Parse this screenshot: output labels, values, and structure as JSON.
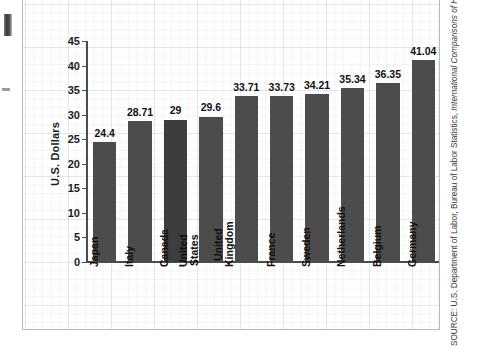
{
  "chart_data": {
    "type": "bar",
    "title": "",
    "subtitle": "",
    "xlabel": "",
    "ylabel": "U.S. Dollars",
    "ylim": [
      0,
      45
    ],
    "ytick_step": 5,
    "yticks": [
      "0",
      "5",
      "10",
      "15",
      "20",
      "25",
      "30",
      "35",
      "40",
      "45"
    ],
    "grid": true,
    "legend": false,
    "legend_position": "none",
    "categories": [
      "Japan",
      "Italy",
      "Canada",
      "United\nStates",
      "United\nKingdom",
      "France",
      "Sweden",
      "Netherlands",
      "Belgium",
      "Germany"
    ],
    "values": [
      24.4,
      28.71,
      29,
      29.6,
      33.71,
      33.73,
      34.21,
      35.34,
      36.35,
      41.04
    ],
    "value_labels": [
      "24.4",
      "28.71",
      "29",
      "29.6",
      "33.71",
      "33.73",
      "34.21",
      "35.34",
      "36.35",
      "41.04"
    ],
    "bar_color": "#4c4c4c",
    "bar_color_highlight": "#3d3d3d",
    "highlight_index": 2,
    "axis_color": "#4c4c4c",
    "grid_color": "#b0c4d7"
  },
  "source": {
    "prefix": "SOURCE: U.S. Department of Labor, Bureau of Labor Statistics, ",
    "italic": "International Comparisons of Hourly Compensation Costs for Production Workers in Manu-"
  }
}
